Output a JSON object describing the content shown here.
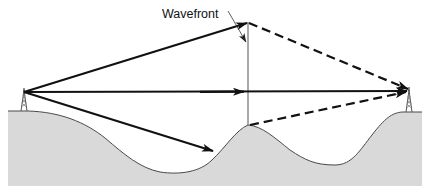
{
  "diagram": {
    "labels": {
      "wavefront": "Wavefront"
    },
    "colors": {
      "ground_fill": "#d9d9d9",
      "ground_stroke": "#4a4a4a",
      "ray": "#111111",
      "wavefront_line": "#555555",
      "background": "#ffffff"
    },
    "elements": {
      "transmitter": "left antenna tower",
      "receiver": "right antenna tower",
      "rays": [
        {
          "name": "upper-ray",
          "style": "solid then dashed",
          "description": "Upward ray to wavefront top, dashed continuation down to receiver"
        },
        {
          "name": "direct-ray",
          "style": "solid",
          "description": "Horizontal direct ray from transmitter to receiver"
        },
        {
          "name": "ground-reflected-ray",
          "style": "solid then dashed",
          "description": "Downward ray striking hillside, dashed path from ridge top to receiver"
        }
      ],
      "wavefront": "vertical line above central ridge"
    }
  }
}
